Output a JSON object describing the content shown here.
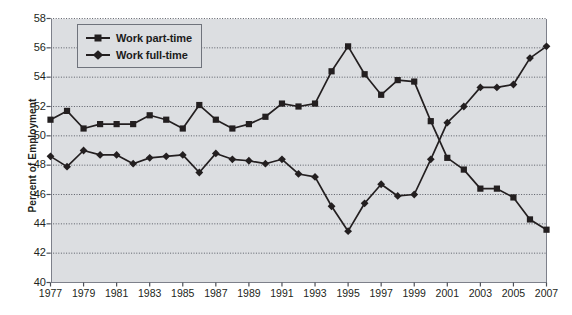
{
  "chart_data": {
    "type": "line",
    "title": "",
    "xlabel": "",
    "ylabel": "Percent of Employment",
    "ylim": [
      40,
      58
    ],
    "ytick_step": 2,
    "yticks": [
      40,
      42,
      44,
      46,
      48,
      50,
      52,
      54,
      56,
      58
    ],
    "xlim": [
      1977,
      2007
    ],
    "x": [
      1977,
      1978,
      1979,
      1980,
      1981,
      1982,
      1983,
      1984,
      1985,
      1986,
      1987,
      1988,
      1989,
      1990,
      1991,
      1992,
      1993,
      1994,
      1995,
      1996,
      1997,
      1998,
      1999,
      2000,
      2001,
      2002,
      2003,
      2004,
      2005,
      2006,
      2007
    ],
    "xtick_labels": [
      "1977",
      "1979",
      "1981",
      "1983",
      "1985",
      "1987",
      "1989",
      "1991",
      "1993",
      "1995",
      "1997",
      "1999",
      "2001",
      "2003",
      "2005",
      "2007"
    ],
    "xticks": [
      1977,
      1979,
      1981,
      1983,
      1985,
      1987,
      1989,
      1991,
      1993,
      1995,
      1997,
      1999,
      2001,
      2003,
      2005,
      2007
    ],
    "grid": true,
    "grid_style": "dotted",
    "legend_position": "top-left-inside",
    "series": [
      {
        "name": "Work part-time",
        "marker": "square",
        "color": "#231f20",
        "values": [
          51.1,
          51.7,
          50.5,
          50.8,
          50.8,
          50.8,
          51.4,
          51.1,
          50.5,
          52.1,
          51.1,
          50.5,
          50.8,
          51.3,
          52.2,
          52.0,
          52.2,
          54.4,
          56.1,
          54.2,
          52.8,
          53.8,
          53.7,
          51.0,
          48.5,
          47.7,
          46.4,
          46.4,
          45.8,
          44.3,
          43.6
        ]
      },
      {
        "name": "Work full-time",
        "marker": "diamond",
        "color": "#231f20",
        "values": [
          48.6,
          47.9,
          49.0,
          48.7,
          48.7,
          48.1,
          48.5,
          48.6,
          48.7,
          47.5,
          48.8,
          48.4,
          48.3,
          48.1,
          48.4,
          47.4,
          47.2,
          45.2,
          43.5,
          45.4,
          46.7,
          45.9,
          46.0,
          48.4,
          50.9,
          52.0,
          53.3,
          53.3,
          53.5,
          55.3,
          56.1
        ]
      }
    ]
  },
  "legend": {
    "items": [
      {
        "label": "Work part-time",
        "marker": "square"
      },
      {
        "label": "Work full-time",
        "marker": "diamond"
      }
    ]
  },
  "axes": {
    "y_title": "Percent of Employment"
  }
}
